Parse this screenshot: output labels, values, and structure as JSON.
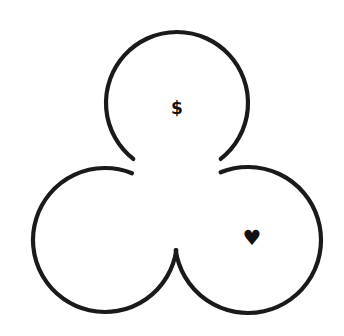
{
  "canvas": {
    "width": 344,
    "height": 336,
    "background_color": "#ffffff",
    "stroke_color": "#1a1a1a",
    "stroke_width": 4.2
  },
  "diagram": {
    "type": "three-circle-trefoil",
    "title": "",
    "circles": [
      {
        "id": "top",
        "name": "top-circle",
        "cx": 177,
        "cy": 103,
        "r": 71,
        "gap_start_deg": 52,
        "gap_end_deg": 128,
        "label": "$",
        "label_name": "dollar-symbol",
        "label_x": 177,
        "label_y": 108
      },
      {
        "id": "bottom-left",
        "name": "bottom-left-circle",
        "cx": 105,
        "cy": 240,
        "r": 72,
        "gap_start_deg": -68,
        "gap_end_deg": 8,
        "label": "",
        "label_name": "",
        "label_x": 105,
        "label_y": 240
      },
      {
        "id": "bottom-right",
        "name": "bottom-right-circle",
        "cx": 248,
        "cy": 240,
        "r": 73,
        "gap_start_deg": 172,
        "gap_end_deg": 248,
        "label": "♥",
        "label_name": "heart-symbol",
        "label_x": 252,
        "label_y": 238
      }
    ]
  },
  "symbols": {
    "dollar": "$",
    "heart": "♥"
  }
}
